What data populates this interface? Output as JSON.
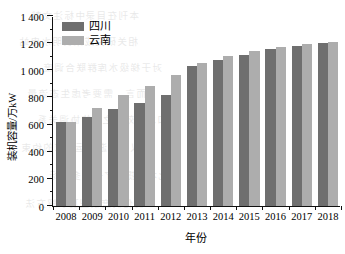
{
  "chart_data": {
    "type": "bar",
    "title": "",
    "xlabel": "年份",
    "ylabel": "装机容量/万kW",
    "categories": [
      "2008",
      "2009",
      "2010",
      "2011",
      "2012",
      "2013",
      "2014",
      "2015",
      "2016",
      "2017",
      "2018"
    ],
    "series": [
      {
        "name": "四川",
        "color": "#6f6f6f",
        "values": [
          618,
          653,
          715,
          760,
          815,
          1030,
          1075,
          1110,
          1160,
          1178,
          1200
        ]
      },
      {
        "name": "云南",
        "color": "#adadad",
        "values": [
          620,
          722,
          820,
          888,
          962,
          1053,
          1103,
          1140,
          1172,
          1195,
          1210
        ]
      }
    ],
    "ylim": [
      0,
      1400
    ],
    "ytick_values": [
      0,
      200,
      400,
      600,
      800,
      1000,
      1200,
      1400
    ],
    "ytick_labels": [
      "0",
      "200",
      "400",
      "600",
      "800",
      "1 000",
      "1 200",
      "1 400"
    ],
    "yminor_step": 100,
    "grid": false,
    "legend_position": "top-left",
    "axis_color": "#111111",
    "background": "#ffffff"
  },
  "legend": {
    "items": [
      {
        "label": "四川",
        "color": "#6f6f6f"
      },
      {
        "label": "云南",
        "color": "#adadad"
      }
    ]
  },
  "ghost_text": {
    "lines": [
      "本刊在目录中标注文献",
      "相关研究成果表明水电站",
      "对于梯级水库群联合调度",
      "而言，需要考虑生态流量",
      "和发电效益之间的协调关系",
      "以及下游航运需求的约束",
      "因此本文提出了一种多目标",
      "优化调度模型及求解方法"
    ]
  }
}
